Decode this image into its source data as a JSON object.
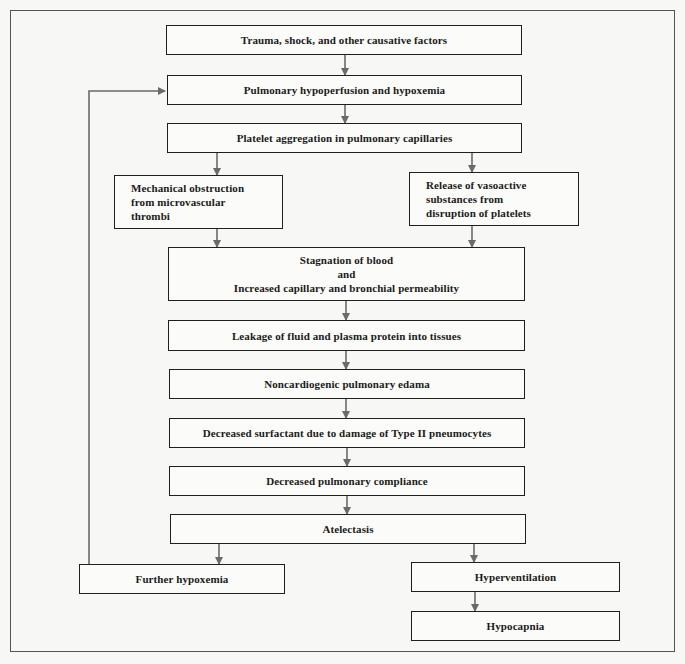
{
  "diagram": {
    "type": "flowchart",
    "nodes": [
      {
        "id": "trauma",
        "label": "Trauma, shock, and other causative factors"
      },
      {
        "id": "hypoperfusion",
        "label": "Pulmonary hypoperfusion and hypoxemia"
      },
      {
        "id": "platelet",
        "label": "Platelet aggregation in pulmonary capillaries"
      },
      {
        "id": "mechanical",
        "label": "Mechanical obstruction\nfrom microvascular\nthrombi"
      },
      {
        "id": "vasoactive",
        "label": "Release of vasoactive\nsubstances from\ndisruption of platelets"
      },
      {
        "id": "stagnation",
        "label": "Stagnation of blood\nand\nIncreased capillary and bronchial permeability"
      },
      {
        "id": "leakage",
        "label": "Leakage of fluid and plasma protein into tissues"
      },
      {
        "id": "edema",
        "label": "Noncardiogenic pulmonary edama"
      },
      {
        "id": "surfactant",
        "label": "Decreased surfactant due to damage of Type II pneumocytes"
      },
      {
        "id": "compliance",
        "label": "Decreased pulmonary compliance"
      },
      {
        "id": "atelectasis",
        "label": "Atelectasis"
      },
      {
        "id": "further_hypoxemia",
        "label": "Further hypoxemia"
      },
      {
        "id": "hyperventilation",
        "label": "Hyperventilation"
      },
      {
        "id": "hypocapnia",
        "label": "Hypocapnia"
      }
    ],
    "edges": [
      [
        "trauma",
        "hypoperfusion"
      ],
      [
        "hypoperfusion",
        "platelet"
      ],
      [
        "platelet",
        "mechanical"
      ],
      [
        "platelet",
        "vasoactive"
      ],
      [
        "mechanical",
        "stagnation"
      ],
      [
        "vasoactive",
        "stagnation"
      ],
      [
        "stagnation",
        "leakage"
      ],
      [
        "leakage",
        "edema"
      ],
      [
        "edema",
        "surfactant"
      ],
      [
        "surfactant",
        "compliance"
      ],
      [
        "compliance",
        "atelectasis"
      ],
      [
        "atelectasis",
        "further_hypoxemia"
      ],
      [
        "atelectasis",
        "hyperventilation"
      ],
      [
        "hyperventilation",
        "hypocapnia"
      ],
      [
        "further_hypoxemia",
        "hypoperfusion"
      ]
    ],
    "colors": {
      "line": "#6a6a6a",
      "box_border": "#1f1f1f",
      "background": "#f7f7f5"
    }
  }
}
